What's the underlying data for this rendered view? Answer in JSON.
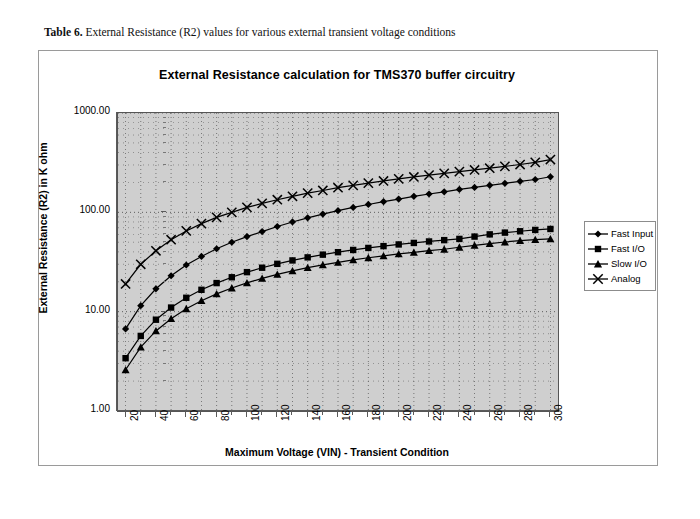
{
  "caption": {
    "label": "Table 6.",
    "text": "External Resistance (R2) values for various external transient voltage conditions"
  },
  "legend": {
    "position": "right",
    "items": [
      {
        "label": "Fast Input",
        "marker": "diamond-marker-icon"
      },
      {
        "label": "Fast I/O",
        "marker": "square-marker-icon"
      },
      {
        "label": "Slow I/O",
        "marker": "triangle-marker-icon"
      },
      {
        "label": "Analog",
        "marker": "cross-marker-icon"
      }
    ]
  },
  "axes": {
    "y_ticks": [
      "1000.00",
      "100.00",
      "10.00",
      "1.00"
    ],
    "x_ticks": [
      "20",
      "40",
      "60",
      "80",
      "100",
      "120",
      "140",
      "160",
      "180",
      "200",
      "220",
      "240",
      "260",
      "280",
      "300"
    ]
  },
  "chart_data": {
    "type": "line",
    "title": "External Resistance calculation for TMS370 buffer circuitry",
    "xlabel": "Maximum Voltage (VIN) - Transient Condition",
    "ylabel": "External Resistance (R2) in K ohm",
    "yscale": "log",
    "ylim": [
      1.0,
      1000.0
    ],
    "xlim": [
      15,
      305
    ],
    "grid": true,
    "legend_position": "right",
    "x": [
      20,
      30,
      40,
      50,
      60,
      70,
      80,
      90,
      100,
      110,
      120,
      130,
      140,
      150,
      160,
      170,
      180,
      190,
      200,
      210,
      220,
      230,
      240,
      250,
      260,
      270,
      280,
      290,
      300
    ],
    "series": [
      {
        "name": "Fast Input",
        "marker": "diamond",
        "values": [
          6.7,
          11.5,
          17.0,
          23.0,
          29.5,
          36.0,
          43.0,
          50.0,
          57.0,
          64.0,
          72.0,
          80.0,
          88.0,
          96.0,
          104.0,
          112.0,
          120.0,
          128.0,
          136.0,
          145.0,
          153.0,
          161.0,
          170.0,
          178.0,
          187.0,
          196.0,
          205.0,
          214.0,
          228.0
        ]
      },
      {
        "name": "Fast I/O",
        "marker": "square",
        "values": [
          3.4,
          5.7,
          8.3,
          11.0,
          13.8,
          16.6,
          19.4,
          22.2,
          25.0,
          27.7,
          30.3,
          32.8,
          35.2,
          37.5,
          39.7,
          41.8,
          43.8,
          45.7,
          47.5,
          49.2,
          50.9,
          52.5,
          54.0,
          57.0,
          60.0,
          62.5,
          64.5,
          66.5,
          68.0
        ]
      },
      {
        "name": "Slow I/O",
        "marker": "triangle",
        "values": [
          2.6,
          4.4,
          6.4,
          8.5,
          10.7,
          12.9,
          15.1,
          17.3,
          19.5,
          21.6,
          23.7,
          25.7,
          27.7,
          29.6,
          31.4,
          33.2,
          34.9,
          36.5,
          38.1,
          39.6,
          41.1,
          42.5,
          44.5,
          46.5,
          48.5,
          50.3,
          51.8,
          53.0,
          54.0
        ]
      },
      {
        "name": "Analog",
        "marker": "cross",
        "values": [
          19.0,
          30.0,
          41.0,
          53.0,
          65.0,
          77.0,
          89.0,
          100.0,
          112.0,
          123.0,
          134.0,
          145.0,
          156.0,
          166.0,
          177.0,
          187.0,
          197.0,
          207.0,
          217.0,
          227.0,
          237.0,
          247.0,
          257.0,
          267.0,
          278.0,
          290.0,
          303.0,
          318.0,
          340.0
        ]
      }
    ]
  }
}
